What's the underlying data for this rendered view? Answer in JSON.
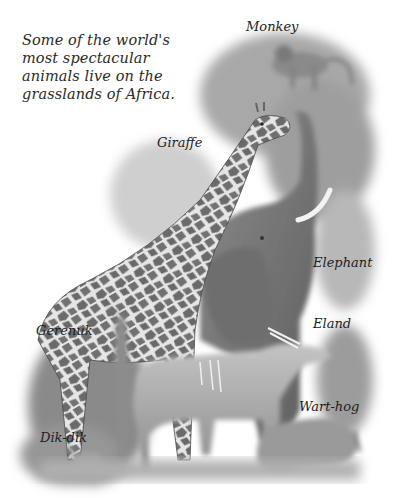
{
  "caption": "Some of the world's most spectacular animals live on the grasslands of Africa.",
  "labels": {
    "monkey": "Monkey",
    "giraffe": "Giraffe",
    "elephant": "Elephant",
    "gerenuk": "Gerenuk",
    "eland": "Eland",
    "warthog": "Wart-hog",
    "dikdik": "Dik-dik"
  },
  "colors": {
    "background": "#ffffff",
    "ink": "#1e1e1e",
    "foliage": "#9a9a9a",
    "elephant": "#7c7c7c",
    "giraffe_patch": "#6a6a6a",
    "giraffe_net": "#e8e8e8",
    "eland": "#b4b4b4"
  }
}
